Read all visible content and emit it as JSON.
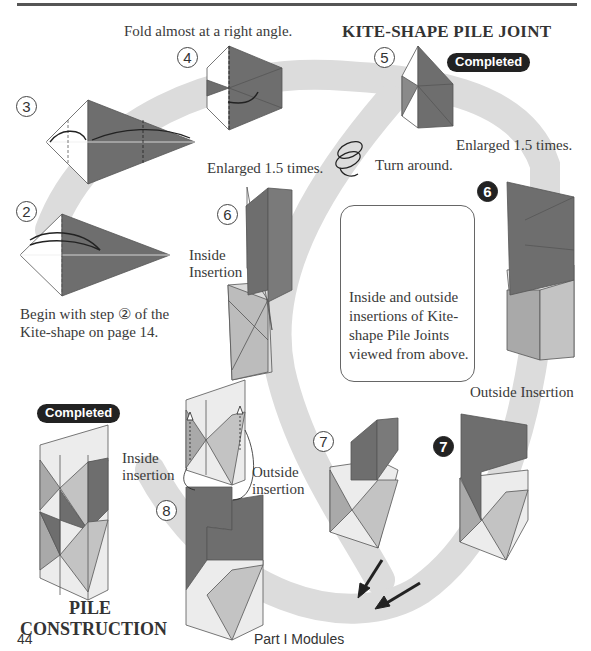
{
  "page": {
    "title": "KITE-SHAPE PILE JOINT",
    "section_title_line1": "PILE",
    "section_title_line2": "CONSTRUCTION",
    "page_number": "44",
    "running_footer": "Part I  Modules"
  },
  "badges": {
    "completed_top": "Completed",
    "completed_bottom": "Completed"
  },
  "steps": {
    "s2": "2",
    "s3": "3",
    "s4": "4",
    "s5": "5",
    "s6_inside": "6",
    "s6_outside": "6",
    "s7_inside": "7",
    "s7_outside": "7",
    "s8": "8"
  },
  "captions": {
    "fold_right_angle": "Fold almost at a right angle.",
    "enlarged_left": "Enlarged 1.5 times.",
    "enlarged_right": "Enlarged 1.5 times.",
    "turn_around": "Turn around.",
    "begin_line1": "Begin with step ② of the",
    "begin_line2": "Kite-shape on page 14.",
    "inside_insertion_cap_l1": "Inside",
    "inside_insertion_cap_l2": "Insertion",
    "outside_insertion_cap": "Outside Insertion",
    "inside_insertion_l1": "Inside",
    "inside_insertion_l2": "insertion",
    "outside_insertion_l1": "Outside",
    "outside_insertion_l2": "insertion"
  },
  "infobox": {
    "text": "Inside and outside insertions of Kite-shape Pile Joints viewed from above."
  },
  "colors": {
    "dark_paper": "#6e6e6e",
    "mid_paper": "#a9a9a9",
    "light_paper": "#ececec",
    "path_band": "#dcdcdc",
    "badge_bg": "#222222"
  },
  "icons": {
    "turn_around": "spiral-arrow-icon",
    "direction_arrows": "diagonal-arrow-icon"
  }
}
